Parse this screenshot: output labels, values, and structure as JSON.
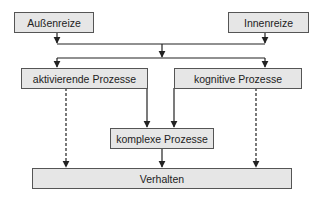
{
  "diagram": {
    "title": "",
    "colors": {
      "box_fill": "#e6e6e6",
      "box_border": "#555555",
      "line": "#222222",
      "text": "#222222"
    },
    "nodes": {
      "aussenreize": "Außenreize",
      "innenreize": "Innenreize",
      "aktivierende": "aktivierende Prozesse",
      "kognitive": "kognitive Prozesse",
      "komplexe": "komplexe Prozesse",
      "verhalten": "Verhalten"
    },
    "edges": [
      {
        "from": "Außenreize",
        "to": "merge",
        "style": "solid"
      },
      {
        "from": "Innenreize",
        "to": "merge",
        "style": "solid"
      },
      {
        "from": "merge",
        "to": "aktivierende Prozesse",
        "style": "solid"
      },
      {
        "from": "merge",
        "to": "kognitive Prozesse",
        "style": "solid"
      },
      {
        "from": "aktivierende Prozesse",
        "to": "komplexe Prozesse",
        "style": "solid"
      },
      {
        "from": "kognitive Prozesse",
        "to": "komplexe Prozesse",
        "style": "solid"
      },
      {
        "from": "aktivierende Prozesse",
        "to": "Verhalten",
        "style": "dashed"
      },
      {
        "from": "kognitive Prozesse",
        "to": "Verhalten",
        "style": "dashed"
      },
      {
        "from": "komplexe Prozesse",
        "to": "Verhalten",
        "style": "solid"
      }
    ]
  }
}
